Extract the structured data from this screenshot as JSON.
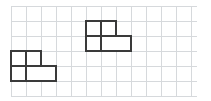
{
  "figure": {
    "item_label": ")",
    "background_color": "#ffffff",
    "grid": {
      "line_color": "#d6d9dc",
      "cell_size_px": 15,
      "origin_x_px": 11,
      "origin_y_px": 6,
      "columns": 12,
      "rows": 6,
      "width_px": 186,
      "height_px": 90
    },
    "stroke_color": "#3a3a3a",
    "stroke_width_px": 2,
    "fill_color": "#ffffff",
    "shapes": [
      {
        "name": "left-shape",
        "description": "P-shaped polyomino of 4 unit squares",
        "cell_count": 4,
        "origin_cell": {
          "col": 0,
          "row": 3
        },
        "cells": [
          {
            "col": 0,
            "row": 3
          },
          {
            "col": 1,
            "row": 3
          },
          {
            "col": 0,
            "row": 4
          },
          {
            "col": 1,
            "row": 4
          },
          {
            "col": 2,
            "row": 4
          }
        ],
        "outline_points": "0,0 2,0 2,1 3,1 3,2 0,2",
        "interior_segments": [
          "1,0 1,2",
          "0,1 3,1"
        ]
      },
      {
        "name": "right-shape",
        "description": "P-shaped polyomino of 5 unit squares",
        "cell_count": 5,
        "origin_cell": {
          "col": 5,
          "row": 1
        },
        "cells": [
          {
            "col": 5,
            "row": 1
          },
          {
            "col": 6,
            "row": 1
          },
          {
            "col": 5,
            "row": 2
          },
          {
            "col": 6,
            "row": 2
          },
          {
            "col": 7,
            "row": 2
          }
        ],
        "outline_points": "0,0 2,0 2,1 3,1 3,2 0,2",
        "interior_segments": [
          "1,0 1,2",
          "0,1 3,1"
        ]
      }
    ]
  }
}
